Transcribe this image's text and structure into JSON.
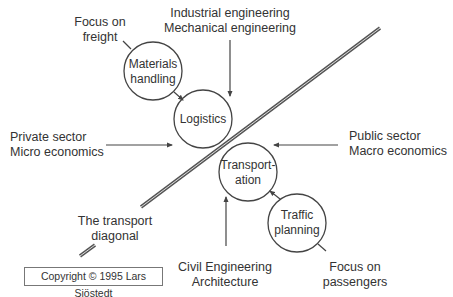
{
  "diagram": {
    "title": "The transport diagonal",
    "nodes": {
      "materials_handling": {
        "line1": "Materials",
        "line2": "handling"
      },
      "logistics": {
        "line1": "Logistics"
      },
      "transportation": {
        "line1": "Transport-",
        "line2": "ation"
      },
      "traffic_planning": {
        "line1": "Traffic",
        "line2": "planning"
      }
    },
    "labels": {
      "focus_freight": {
        "line1": "Focus on",
        "line2": "freight"
      },
      "engineering": {
        "line1": "Industrial engineering",
        "line2": "Mechanical engineering"
      },
      "private_sector": {
        "line1": "Private sector",
        "line2": "Micro economics"
      },
      "public_sector": {
        "line1": "Public sector",
        "line2": "Macro economics"
      },
      "diagonal": {
        "line1": "The transport",
        "line2": "diagonal"
      },
      "civil": {
        "line1": "Civil Engineering",
        "line2": "Architecture"
      },
      "focus_passengers": {
        "line1": "Focus on",
        "line2": "passengers"
      }
    },
    "copyright": "Copyright © 1995 Lars Sjöstedt",
    "colors": {
      "line": "#444444",
      "text": "#333333",
      "background": "#ffffff"
    }
  }
}
